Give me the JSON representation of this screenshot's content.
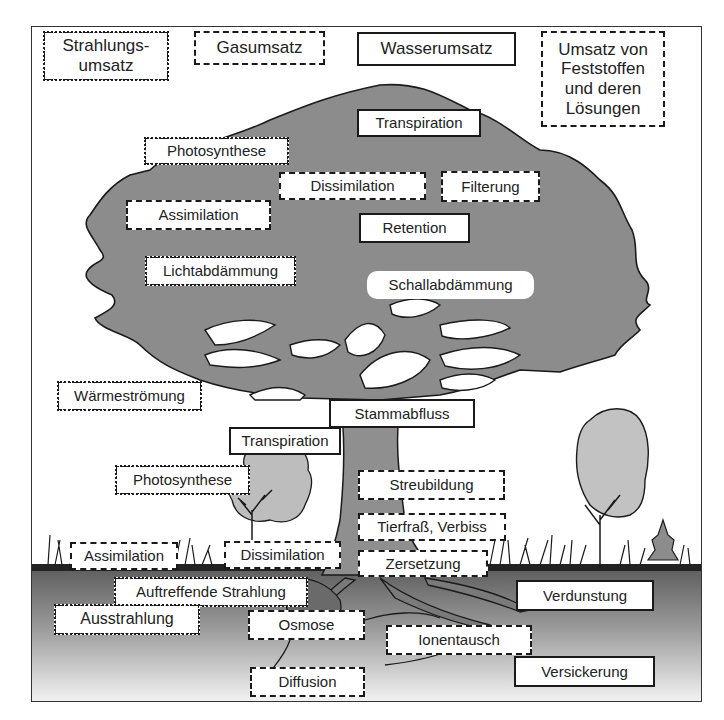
{
  "diagram": {
    "colors": {
      "canopy": "#8c8c8c",
      "trunk": "#8f8f8f",
      "small_tree": "#bdbdbd",
      "soil_top": "#6e6e6e",
      "soil_bottom": "#eeeeee",
      "outline": "#1a1a1a",
      "label_bg": "#ffffff"
    },
    "legend": [
      {
        "id": "radiation",
        "label": "Strahlungs-\numsatz",
        "border": "dash-dot"
      },
      {
        "id": "gas",
        "label": "Gasumsatz",
        "border": "short-dashed"
      },
      {
        "id": "water",
        "label": "Wasserumsatz",
        "border": "solid"
      },
      {
        "id": "solids",
        "label": "Umsatz von Feststoffen und deren Lösungen",
        "border": "long-dashed"
      }
    ],
    "labels": {
      "transpiration_top": "Transpiration",
      "photosynthese_top": "Photosynthese",
      "dissimilation_top": "Dissimilation",
      "filterung": "Filterung",
      "assimilation_top": "Assimilation",
      "retention": "Retention",
      "lichtabdaemmung": "Lichtabdämmung",
      "schallabdaemmung": "Schallabdämmung",
      "waermestroemung": "Wärmeströmung",
      "stammabfluss": "Stammabfluss",
      "transpiration_mid": "Transpiration",
      "photosynthese_mid": "Photosynthese",
      "streubildung": "Streubildung",
      "tierfrass": "Tierfraß, Verbiss",
      "assimilation_ground": "Assimilation",
      "dissimilation_ground": "Dissimilation",
      "zersetzung": "Zersetzung",
      "auftreffende_strahlung": "Auftreffende Strahlung",
      "verdunstung": "Verdunstung",
      "ausstrahlung": "Ausstrahlung",
      "osmose": "Osmose",
      "ionentausch": "Ionentausch",
      "versickerung": "Versickerung",
      "diffusion": "Diffusion"
    }
  }
}
